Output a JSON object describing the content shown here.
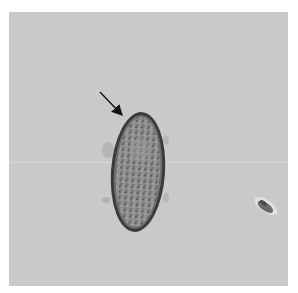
{
  "image": {
    "description": "Light micrograph of an elongated oval egg with thick shell and granular contents; arrow points to one pole",
    "background_color": "#c9c9c9",
    "border_color": "#ffffff"
  },
  "annotations": [
    {
      "type": "arrow",
      "label": "",
      "from": [
        100,
        92
      ],
      "to": [
        122,
        115
      ]
    }
  ],
  "objects": [
    {
      "name": "egg",
      "center": [
        138,
        172
      ],
      "size": [
        54,
        120
      ]
    },
    {
      "name": "debris",
      "center": [
        266,
        206
      ],
      "size": [
        26,
        20
      ]
    }
  ]
}
